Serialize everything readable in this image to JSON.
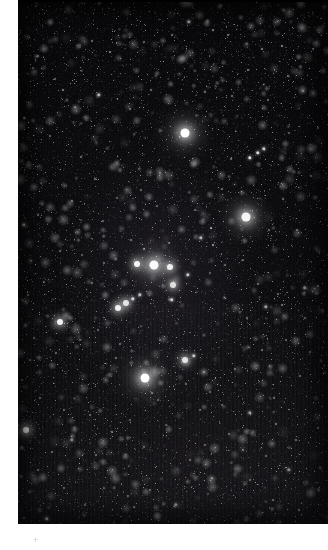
{
  "page": {
    "width": 328,
    "height": 550,
    "background_color": "#ffffff",
    "caption": ""
  },
  "photo": {
    "name": "star-field-photograph",
    "subject": "Open star cluster in a dense star field",
    "frame": {
      "x": 18,
      "y": 0,
      "width": 310,
      "height": 524
    },
    "background_color": "#050507",
    "star_color": "#ffffff",
    "margins": {
      "left": 18,
      "bottom": 26,
      "top": 0,
      "right": 0
    }
  },
  "registration_mark": {
    "glyph": "+",
    "x": 36,
    "y": 540,
    "color": "#cfcfcf"
  },
  "chart_data": {
    "type": "scatter",
    "xlabel": "",
    "ylabel": "",
    "xlim": [
      18,
      328
    ],
    "ylim": [
      0,
      524
    ],
    "grid": false,
    "legend": null,
    "point_classes": {
      "xl": {
        "diameter_px": 9,
        "label": "very bright"
      },
      "lg": {
        "diameter_px": 6,
        "label": "bright"
      },
      "md": {
        "diameter_px": 3.4,
        "label": "medium"
      },
      "sm": {
        "diameter_px": 2,
        "label": "faint"
      },
      "xs": {
        "diameter_px": 1.3,
        "label": "very faint"
      }
    },
    "stars": [
      {
        "x": 185,
        "y": 133,
        "class": "xl",
        "opacity": 1.0
      },
      {
        "x": 145,
        "y": 378,
        "class": "xl",
        "opacity": 1.0
      },
      {
        "x": 154,
        "y": 265,
        "class": "xl",
        "opacity": 0.98
      },
      {
        "x": 246,
        "y": 217,
        "class": "xl",
        "opacity": 0.96
      },
      {
        "x": 137,
        "y": 264,
        "class": "lg",
        "opacity": 0.95
      },
      {
        "x": 170,
        "y": 267,
        "class": "lg",
        "opacity": 0.93
      },
      {
        "x": 60,
        "y": 322,
        "class": "lg",
        "opacity": 0.95
      },
      {
        "x": 26,
        "y": 430,
        "class": "lg",
        "opacity": 0.95
      },
      {
        "x": 118,
        "y": 308,
        "class": "lg",
        "opacity": 0.93
      },
      {
        "x": 126,
        "y": 303,
        "class": "lg",
        "opacity": 0.88
      },
      {
        "x": 133,
        "y": 299,
        "class": "md",
        "opacity": 0.82
      },
      {
        "x": 140,
        "y": 295,
        "class": "md",
        "opacity": 0.72
      },
      {
        "x": 250,
        "y": 158,
        "class": "md",
        "opacity": 0.86
      },
      {
        "x": 258,
        "y": 153,
        "class": "md",
        "opacity": 0.84
      },
      {
        "x": 264,
        "y": 149,
        "class": "md",
        "opacity": 0.76
      },
      {
        "x": 185,
        "y": 360,
        "class": "lg",
        "opacity": 0.86
      },
      {
        "x": 194,
        "y": 356,
        "class": "md",
        "opacity": 0.74
      },
      {
        "x": 173,
        "y": 285,
        "class": "lg",
        "opacity": 0.84
      },
      {
        "x": 188,
        "y": 275,
        "class": "md",
        "opacity": 0.75
      },
      {
        "x": 172,
        "y": 300,
        "class": "md",
        "opacity": 0.78
      },
      {
        "x": 201,
        "y": 238,
        "class": "md",
        "opacity": 0.68
      },
      {
        "x": 211,
        "y": 228,
        "class": "sm",
        "opacity": 0.6
      },
      {
        "x": 213,
        "y": 245,
        "class": "sm",
        "opacity": 0.6
      },
      {
        "x": 99,
        "y": 95,
        "class": "md",
        "opacity": 0.62
      },
      {
        "x": 189,
        "y": 22,
        "class": "md",
        "opacity": 0.58
      },
      {
        "x": 63,
        "y": 90,
        "class": "sm",
        "opacity": 0.5
      },
      {
        "x": 110,
        "y": 52,
        "class": "sm",
        "opacity": 0.5
      },
      {
        "x": 213,
        "y": 30,
        "class": "sm",
        "opacity": 0.5
      },
      {
        "x": 282,
        "y": 46,
        "class": "sm",
        "opacity": 0.55
      },
      {
        "x": 262,
        "y": 49,
        "class": "sm",
        "opacity": 0.5
      },
      {
        "x": 228,
        "y": 35,
        "class": "sm",
        "opacity": 0.45
      },
      {
        "x": 288,
        "y": 76,
        "class": "sm",
        "opacity": 0.45
      },
      {
        "x": 248,
        "y": 70,
        "class": "sm",
        "opacity": 0.45
      },
      {
        "x": 172,
        "y": 35,
        "class": "sm",
        "opacity": 0.42
      },
      {
        "x": 144,
        "y": 42,
        "class": "sm",
        "opacity": 0.4
      },
      {
        "x": 92,
        "y": 41,
        "class": "sm",
        "opacity": 0.42
      },
      {
        "x": 38,
        "y": 56,
        "class": "sm",
        "opacity": 0.4
      },
      {
        "x": 33,
        "y": 68,
        "class": "sm",
        "opacity": 0.38
      },
      {
        "x": 55,
        "y": 79,
        "class": "sm",
        "opacity": 0.38
      },
      {
        "x": 75,
        "y": 107,
        "class": "sm",
        "opacity": 0.4
      },
      {
        "x": 130,
        "y": 109,
        "class": "sm",
        "opacity": 0.42
      },
      {
        "x": 151,
        "y": 90,
        "class": "sm",
        "opacity": 0.44
      },
      {
        "x": 205,
        "y": 92,
        "class": "sm",
        "opacity": 0.46
      },
      {
        "x": 232,
        "y": 96,
        "class": "sm",
        "opacity": 0.42
      },
      {
        "x": 268,
        "y": 100,
        "class": "sm",
        "opacity": 0.42
      },
      {
        "x": 303,
        "y": 91,
        "class": "sm",
        "opacity": 0.4
      },
      {
        "x": 313,
        "y": 49,
        "class": "sm",
        "opacity": 0.38
      },
      {
        "x": 24,
        "y": 118,
        "class": "sm",
        "opacity": 0.36
      },
      {
        "x": 50,
        "y": 136,
        "class": "sm",
        "opacity": 0.4
      },
      {
        "x": 81,
        "y": 157,
        "class": "sm",
        "opacity": 0.44
      },
      {
        "x": 95,
        "y": 179,
        "class": "sm",
        "opacity": 0.42
      },
      {
        "x": 72,
        "y": 201,
        "class": "sm",
        "opacity": 0.44
      },
      {
        "x": 38,
        "y": 215,
        "class": "sm",
        "opacity": 0.42
      },
      {
        "x": 24,
        "y": 225,
        "class": "md",
        "opacity": 0.56
      },
      {
        "x": 60,
        "y": 251,
        "class": "sm",
        "opacity": 0.4
      },
      {
        "x": 103,
        "y": 221,
        "class": "sm",
        "opacity": 0.38
      },
      {
        "x": 117,
        "y": 198,
        "class": "sm",
        "opacity": 0.36
      },
      {
        "x": 141,
        "y": 190,
        "class": "sm",
        "opacity": 0.4
      },
      {
        "x": 160,
        "y": 173,
        "class": "sm",
        "opacity": 0.36
      },
      {
        "x": 157,
        "y": 206,
        "class": "sm",
        "opacity": 0.36
      },
      {
        "x": 131,
        "y": 240,
        "class": "sm",
        "opacity": 0.42
      },
      {
        "x": 144,
        "y": 249,
        "class": "sm",
        "opacity": 0.5
      },
      {
        "x": 169,
        "y": 243,
        "class": "sm",
        "opacity": 0.4
      },
      {
        "x": 195,
        "y": 210,
        "class": "sm",
        "opacity": 0.4
      },
      {
        "x": 222,
        "y": 189,
        "class": "sm",
        "opacity": 0.42
      },
      {
        "x": 231,
        "y": 159,
        "class": "sm",
        "opacity": 0.4
      },
      {
        "x": 289,
        "y": 133,
        "class": "sm",
        "opacity": 0.38
      },
      {
        "x": 318,
        "y": 128,
        "class": "sm",
        "opacity": 0.36
      },
      {
        "x": 311,
        "y": 176,
        "class": "sm",
        "opacity": 0.36
      },
      {
        "x": 283,
        "y": 199,
        "class": "sm",
        "opacity": 0.4
      },
      {
        "x": 269,
        "y": 230,
        "class": "sm",
        "opacity": 0.4
      },
      {
        "x": 297,
        "y": 230,
        "class": "sm",
        "opacity": 0.38
      },
      {
        "x": 225,
        "y": 265,
        "class": "sm",
        "opacity": 0.4
      },
      {
        "x": 243,
        "y": 260,
        "class": "sm",
        "opacity": 0.36
      },
      {
        "x": 210,
        "y": 273,
        "class": "sm",
        "opacity": 0.38
      },
      {
        "x": 258,
        "y": 284,
        "class": "sm",
        "opacity": 0.42
      },
      {
        "x": 278,
        "y": 294,
        "class": "sm",
        "opacity": 0.4
      },
      {
        "x": 305,
        "y": 288,
        "class": "md",
        "opacity": 0.5
      },
      {
        "x": 318,
        "y": 286,
        "class": "sm",
        "opacity": 0.44
      },
      {
        "x": 266,
        "y": 307,
        "class": "md",
        "opacity": 0.58
      },
      {
        "x": 282,
        "y": 305,
        "class": "sm",
        "opacity": 0.45
      },
      {
        "x": 247,
        "y": 318,
        "class": "sm",
        "opacity": 0.4
      },
      {
        "x": 305,
        "y": 318,
        "class": "sm",
        "opacity": 0.4
      },
      {
        "x": 92,
        "y": 283,
        "class": "sm",
        "opacity": 0.42
      },
      {
        "x": 104,
        "y": 263,
        "class": "sm",
        "opacity": 0.4
      },
      {
        "x": 82,
        "y": 255,
        "class": "sm",
        "opacity": 0.36
      },
      {
        "x": 44,
        "y": 282,
        "class": "sm",
        "opacity": 0.38
      },
      {
        "x": 28,
        "y": 295,
        "class": "sm",
        "opacity": 0.42
      },
      {
        "x": 34,
        "y": 338,
        "class": "sm",
        "opacity": 0.38
      },
      {
        "x": 56,
        "y": 353,
        "class": "sm",
        "opacity": 0.4
      },
      {
        "x": 80,
        "y": 340,
        "class": "sm",
        "opacity": 0.36
      },
      {
        "x": 98,
        "y": 330,
        "class": "sm",
        "opacity": 0.38
      },
      {
        "x": 120,
        "y": 344,
        "class": "sm",
        "opacity": 0.4
      },
      {
        "x": 116,
        "y": 358,
        "class": "sm",
        "opacity": 0.42
      },
      {
        "x": 160,
        "y": 340,
        "class": "sm",
        "opacity": 0.4
      },
      {
        "x": 152,
        "y": 393,
        "class": "sm",
        "opacity": 0.46
      },
      {
        "x": 158,
        "y": 400,
        "class": "sm",
        "opacity": 0.4
      },
      {
        "x": 186,
        "y": 384,
        "class": "sm",
        "opacity": 0.4
      },
      {
        "x": 204,
        "y": 372,
        "class": "sm",
        "opacity": 0.36
      },
      {
        "x": 210,
        "y": 392,
        "class": "sm",
        "opacity": 0.38
      },
      {
        "x": 235,
        "y": 369,
        "class": "sm",
        "opacity": 0.4
      },
      {
        "x": 262,
        "y": 350,
        "class": "sm",
        "opacity": 0.42
      },
      {
        "x": 286,
        "y": 340,
        "class": "sm",
        "opacity": 0.38
      },
      {
        "x": 310,
        "y": 352,
        "class": "sm",
        "opacity": 0.36
      },
      {
        "x": 300,
        "y": 376,
        "class": "sm",
        "opacity": 0.4
      },
      {
        "x": 274,
        "y": 398,
        "class": "sm",
        "opacity": 0.4
      },
      {
        "x": 250,
        "y": 413,
        "class": "md",
        "opacity": 0.56
      },
      {
        "x": 276,
        "y": 424,
        "class": "sm",
        "opacity": 0.44
      },
      {
        "x": 296,
        "y": 440,
        "class": "sm",
        "opacity": 0.4
      },
      {
        "x": 318,
        "y": 428,
        "class": "sm",
        "opacity": 0.4
      },
      {
        "x": 229,
        "y": 434,
        "class": "sm",
        "opacity": 0.4
      },
      {
        "x": 243,
        "y": 450,
        "class": "sm",
        "opacity": 0.38
      },
      {
        "x": 266,
        "y": 456,
        "class": "sm",
        "opacity": 0.4
      },
      {
        "x": 289,
        "y": 470,
        "class": "md",
        "opacity": 0.5
      },
      {
        "x": 273,
        "y": 500,
        "class": "sm",
        "opacity": 0.44
      },
      {
        "x": 299,
        "y": 510,
        "class": "sm",
        "opacity": 0.4
      },
      {
        "x": 250,
        "y": 480,
        "class": "sm",
        "opacity": 0.38
      },
      {
        "x": 212,
        "y": 478,
        "class": "sm",
        "opacity": 0.36
      },
      {
        "x": 190,
        "y": 460,
        "class": "sm",
        "opacity": 0.4
      },
      {
        "x": 205,
        "y": 445,
        "class": "sm",
        "opacity": 0.38
      },
      {
        "x": 176,
        "y": 505,
        "class": "md",
        "opacity": 0.54
      },
      {
        "x": 150,
        "y": 490,
        "class": "sm",
        "opacity": 0.4
      },
      {
        "x": 134,
        "y": 507,
        "class": "sm",
        "opacity": 0.42
      },
      {
        "x": 128,
        "y": 496,
        "class": "sm",
        "opacity": 0.38
      },
      {
        "x": 104,
        "y": 488,
        "class": "sm",
        "opacity": 0.36
      },
      {
        "x": 85,
        "y": 505,
        "class": "sm",
        "opacity": 0.38
      },
      {
        "x": 64,
        "y": 488,
        "class": "sm",
        "opacity": 0.36
      },
      {
        "x": 47,
        "y": 519,
        "class": "md",
        "opacity": 0.66
      },
      {
        "x": 24,
        "y": 518,
        "class": "sm",
        "opacity": 0.45
      },
      {
        "x": 38,
        "y": 470,
        "class": "sm",
        "opacity": 0.4
      },
      {
        "x": 52,
        "y": 452,
        "class": "sm",
        "opacity": 0.4
      },
      {
        "x": 72,
        "y": 440,
        "class": "md",
        "opacity": 0.48
      },
      {
        "x": 96,
        "y": 455,
        "class": "sm",
        "opacity": 0.4
      },
      {
        "x": 112,
        "y": 432,
        "class": "sm",
        "opacity": 0.42
      },
      {
        "x": 90,
        "y": 415,
        "class": "sm",
        "opacity": 0.4
      },
      {
        "x": 64,
        "y": 410,
        "class": "sm",
        "opacity": 0.38
      },
      {
        "x": 40,
        "y": 398,
        "class": "sm",
        "opacity": 0.36
      },
      {
        "x": 22,
        "y": 380,
        "class": "sm",
        "opacity": 0.36
      },
      {
        "x": 30,
        "y": 360,
        "class": "sm",
        "opacity": 0.34
      },
      {
        "x": 130,
        "y": 420,
        "class": "sm",
        "opacity": 0.36
      },
      {
        "x": 166,
        "y": 425,
        "class": "sm",
        "opacity": 0.34
      },
      {
        "x": 144,
        "y": 447,
        "class": "sm",
        "opacity": 0.34
      },
      {
        "x": 200,
        "y": 410,
        "class": "sm",
        "opacity": 0.34
      },
      {
        "x": 222,
        "y": 405,
        "class": "sm",
        "opacity": 0.34
      },
      {
        "x": 60,
        "y": 170,
        "class": "xs",
        "opacity": 0.3
      },
      {
        "x": 111,
        "y": 142,
        "class": "xs",
        "opacity": 0.3
      },
      {
        "x": 168,
        "y": 150,
        "class": "xs",
        "opacity": 0.3
      },
      {
        "x": 200,
        "y": 125,
        "class": "xs",
        "opacity": 0.3
      },
      {
        "x": 222,
        "y": 113,
        "class": "xs",
        "opacity": 0.3
      },
      {
        "x": 253,
        "y": 122,
        "class": "xs",
        "opacity": 0.3
      },
      {
        "x": 278,
        "y": 165,
        "class": "xs",
        "opacity": 0.3
      },
      {
        "x": 122,
        "y": 166,
        "class": "xs",
        "opacity": 0.3
      },
      {
        "x": 44,
        "y": 160,
        "class": "xs",
        "opacity": 0.3
      },
      {
        "x": 30,
        "y": 190,
        "class": "xs",
        "opacity": 0.3
      },
      {
        "x": 52,
        "y": 232,
        "class": "xs",
        "opacity": 0.3
      },
      {
        "x": 88,
        "y": 205,
        "class": "xs",
        "opacity": 0.3
      },
      {
        "x": 118,
        "y": 272,
        "class": "xs",
        "opacity": 0.3
      },
      {
        "x": 192,
        "y": 322,
        "class": "xs",
        "opacity": 0.3
      },
      {
        "x": 214,
        "y": 330,
        "class": "xs",
        "opacity": 0.3
      },
      {
        "x": 238,
        "y": 340,
        "class": "xs",
        "opacity": 0.3
      },
      {
        "x": 168,
        "y": 317,
        "class": "xs",
        "opacity": 0.3
      },
      {
        "x": 148,
        "y": 320,
        "class": "xs",
        "opacity": 0.3
      },
      {
        "x": 136,
        "y": 282,
        "class": "xs",
        "opacity": 0.3
      },
      {
        "x": 202,
        "y": 292,
        "class": "xs",
        "opacity": 0.3
      },
      {
        "x": 72,
        "y": 300,
        "class": "xs",
        "opacity": 0.3
      },
      {
        "x": 46,
        "y": 308,
        "class": "xs",
        "opacity": 0.3
      },
      {
        "x": 262,
        "y": 200,
        "class": "xs",
        "opacity": 0.3
      },
      {
        "x": 300,
        "y": 256,
        "class": "xs",
        "opacity": 0.3
      },
      {
        "x": 318,
        "y": 208,
        "class": "xs",
        "opacity": 0.3
      },
      {
        "x": 182,
        "y": 200,
        "class": "xs",
        "opacity": 0.3
      },
      {
        "x": 206,
        "y": 172,
        "class": "xs",
        "opacity": 0.3
      },
      {
        "x": 240,
        "y": 290,
        "class": "xs",
        "opacity": 0.3
      }
    ]
  }
}
